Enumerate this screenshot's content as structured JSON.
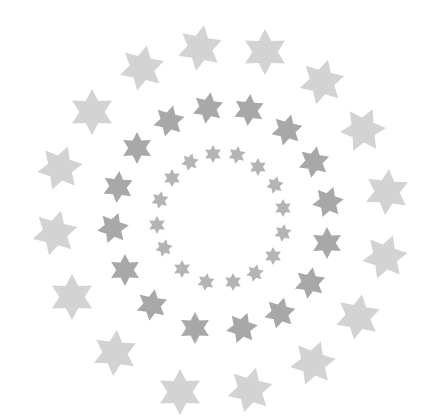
{
  "image": {
    "width": 438,
    "height": 420,
    "background": "#ffffff",
    "description": "Three concentric rings of six-pointed stars"
  },
  "rings": [
    {
      "name": "outer",
      "color": "#d3d3d3",
      "size": 23,
      "stars": [
        {
          "x": 200,
          "y": 48,
          "rot": 10
        },
        {
          "x": 265,
          "y": 52,
          "rot": 0
        },
        {
          "x": 322,
          "y": 82,
          "rot": 15
        },
        {
          "x": 363,
          "y": 130,
          "rot": 25
        },
        {
          "x": 387,
          "y": 192,
          "rot": 5
        },
        {
          "x": 385,
          "y": 257,
          "rot": 20
        },
        {
          "x": 358,
          "y": 317,
          "rot": 10
        },
        {
          "x": 313,
          "y": 363,
          "rot": 20
        },
        {
          "x": 250,
          "y": 390,
          "rot": 15
        },
        {
          "x": 180,
          "y": 392,
          "rot": 0
        },
        {
          "x": 115,
          "y": 353,
          "rot": 5
        },
        {
          "x": 72,
          "y": 297,
          "rot": 0
        },
        {
          "x": 55,
          "y": 233,
          "rot": 15
        },
        {
          "x": 60,
          "y": 168,
          "rot": 20
        },
        {
          "x": 92,
          "y": 112,
          "rot": 0
        },
        {
          "x": 142,
          "y": 68,
          "rot": 12
        }
      ]
    },
    {
      "name": "middle",
      "color": "#a8a8a8",
      "size": 16,
      "stars": [
        {
          "x": 208,
          "y": 108,
          "rot": 10
        },
        {
          "x": 249,
          "y": 110,
          "rot": 5
        },
        {
          "x": 287,
          "y": 130,
          "rot": 15
        },
        {
          "x": 314,
          "y": 162,
          "rot": 10
        },
        {
          "x": 328,
          "y": 202,
          "rot": 20
        },
        {
          "x": 327,
          "y": 243,
          "rot": 0
        },
        {
          "x": 310,
          "y": 283,
          "rot": 10
        },
        {
          "x": 280,
          "y": 313,
          "rot": 15
        },
        {
          "x": 242,
          "y": 328,
          "rot": 20
        },
        {
          "x": 195,
          "y": 328,
          "rot": 0
        },
        {
          "x": 152,
          "y": 305,
          "rot": 10
        },
        {
          "x": 125,
          "y": 270,
          "rot": 0
        },
        {
          "x": 113,
          "y": 228,
          "rot": 20
        },
        {
          "x": 118,
          "y": 187,
          "rot": 5
        },
        {
          "x": 137,
          "y": 148,
          "rot": 0
        },
        {
          "x": 169,
          "y": 121,
          "rot": 15
        }
      ]
    },
    {
      "name": "inner",
      "color": "#b4b4b4",
      "size": 9,
      "stars": [
        {
          "x": 213,
          "y": 154,
          "rot": 0
        },
        {
          "x": 237,
          "y": 155,
          "rot": 10
        },
        {
          "x": 258,
          "y": 167,
          "rot": 0
        },
        {
          "x": 275,
          "y": 185,
          "rot": 15
        },
        {
          "x": 283,
          "y": 208,
          "rot": 0
        },
        {
          "x": 283,
          "y": 233,
          "rot": 10
        },
        {
          "x": 273,
          "y": 256,
          "rot": 0
        },
        {
          "x": 255,
          "y": 273,
          "rot": 15
        },
        {
          "x": 233,
          "y": 282,
          "rot": 0
        },
        {
          "x": 206,
          "y": 282,
          "rot": 10
        },
        {
          "x": 182,
          "y": 269,
          "rot": 0
        },
        {
          "x": 164,
          "y": 248,
          "rot": 15
        },
        {
          "x": 157,
          "y": 225,
          "rot": 0
        },
        {
          "x": 160,
          "y": 200,
          "rot": 10
        },
        {
          "x": 172,
          "y": 178,
          "rot": 0
        },
        {
          "x": 190,
          "y": 162,
          "rot": 15
        }
      ]
    }
  ]
}
